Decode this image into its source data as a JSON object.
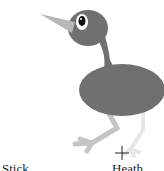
{
  "image": {
    "subject": "cartoon bird",
    "colors": {
      "body": "#707070",
      "beak": "#b8b8b8",
      "leg_front": "#c4c4c4",
      "leg_back": "#e6e6e6",
      "eye_ring": "#ffffff",
      "pupil": "#111111"
    },
    "cursor": "crosshair",
    "captions": [
      "Stick",
      "Heath"
    ]
  }
}
